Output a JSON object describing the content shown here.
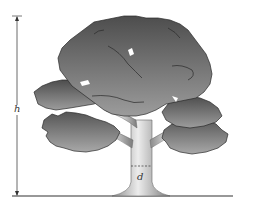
{
  "diagram": {
    "labels": {
      "height": "h",
      "diameter": "d"
    },
    "colors": {
      "background": "#ffffff",
      "foliage_dark": "#4a4a4a",
      "foliage_light": "#9a9a9a",
      "outline": "#2a2a2a",
      "trunk_light": "#e6e6e6",
      "trunk_dark": "#8c8c8c",
      "ground": "#333333",
      "dimension_line": "#333333"
    }
  }
}
